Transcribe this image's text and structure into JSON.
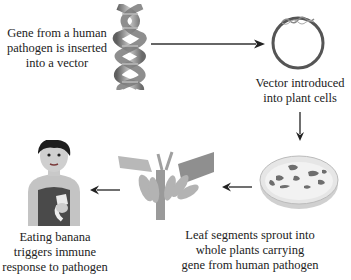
{
  "steps": [
    {
      "id": "gene",
      "label_lines": [
        "Gene from a human",
        "pathogen is inserted",
        "into a vector"
      ],
      "icon": "dna-helix"
    },
    {
      "id": "vector",
      "label_lines": [
        "Vector introduced",
        "into plant cells"
      ],
      "icon": "plasmid"
    },
    {
      "id": "dish",
      "label_lines": [],
      "icon": "petri-dish"
    },
    {
      "id": "plant",
      "label_lines": [
        "Leaf segments sprout into",
        "whole plants carrying",
        "gene from human pathogen"
      ],
      "icon": "banana-plant"
    },
    {
      "id": "person",
      "label_lines": [
        "Eating banana",
        "triggers immune",
        "response to pathogen"
      ],
      "icon": "person-eating-banana"
    }
  ],
  "colors": {
    "arrow": "#333333",
    "text": "#222222",
    "helix": "#8a8a8a",
    "plasmid": "#555555",
    "dish": "#d8d8d8",
    "plant": "#a9a9a9"
  }
}
